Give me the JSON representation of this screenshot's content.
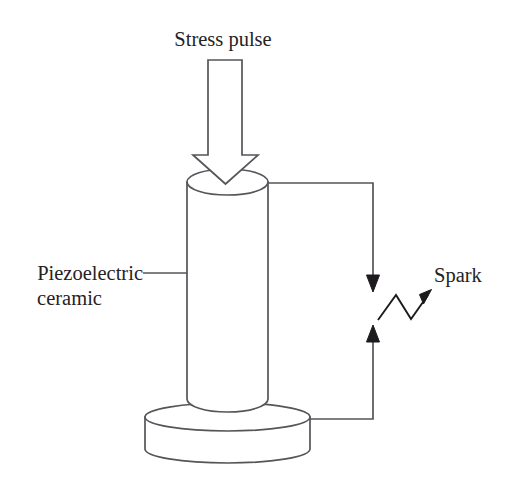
{
  "figure": {
    "background_color": "#ffffff",
    "stroke_color": "#57545a",
    "fill_color": "#ffffff",
    "text_color": "#262224",
    "width": 516,
    "height": 496
  },
  "labels": {
    "stress_pulse": "Stress pulse",
    "piezoelectric_line1": "Piezoelectric",
    "piezoelectric_line2": "ceramic",
    "spark": "Spark"
  },
  "parts": {
    "stress_arrow": {
      "name": "stress-pulse-arrow",
      "type": "hollow-block-arrow",
      "direction": "down",
      "shaft_left": 208,
      "shaft_right": 242,
      "shaft_top": 60,
      "head_left": 193,
      "head_right": 258,
      "head_top": 155,
      "tip_y": 184
    },
    "ceramic_cylinder": {
      "name": "piezoelectric-ceramic-cylinder",
      "left": 187,
      "right": 268,
      "top_ellipse_center_y": 182,
      "top_ellipse_ry": 13,
      "bottom_y": 412
    },
    "base_disc": {
      "name": "base-disc",
      "left": 145,
      "right": 310,
      "top_ellipse_center_y": 417,
      "top_ellipse_ry": 14,
      "bottom_y": 463
    },
    "wire": {
      "name": "electrode-wire",
      "top_y": 183,
      "bottom_y": 419,
      "right_x": 373,
      "from_x_top": 268,
      "from_x_bottom": 310
    },
    "spark_gap": {
      "name": "spark-gap",
      "upper_arrow_tip_y": 292,
      "lower_arrow_tip_y": 325,
      "zigzag_points": "378,320 396,295 411,319 430,294"
    }
  },
  "icons": {
    "stress_arrow": "down-block-arrow-icon",
    "spark": "lightning-zigzag-icon",
    "charge_down": "down-arrow-icon",
    "charge_up": "up-arrow-icon"
  }
}
